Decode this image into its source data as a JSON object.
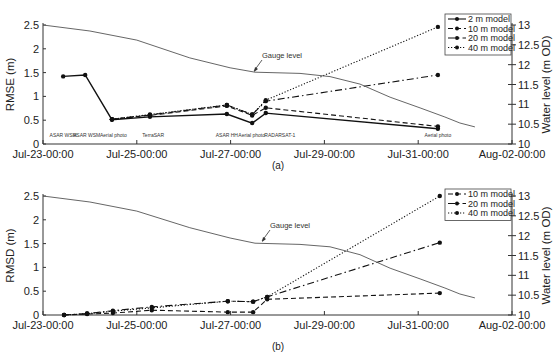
{
  "figure": {
    "panels": [
      {
        "caption": "(a)",
        "ylabel_left": "RMSE (m)",
        "ylabel_right": "Water level (m OD)",
        "annotation": "Gauge level"
      },
      {
        "caption": "(b)",
        "ylabel_left": "RMSD (m)",
        "ylabel_right": "Water level (m OD)",
        "annotation": "Gauge level"
      }
    ],
    "xticks": [
      "Jul-23-00:00",
      "Jul-25-00:00",
      "Jul-27-00:00",
      "Jul-29-00:00",
      "Jul-31-00:00",
      "Aug-02-00:00"
    ],
    "yticks_left": [
      "0",
      "0.5",
      "1",
      "1.5",
      "2",
      "2.5"
    ],
    "yticks_right": [
      "10",
      "10.5",
      "11",
      "11.5",
      "12",
      "12.5",
      "13"
    ],
    "sensor_labels": [
      {
        "text": "ASAR WSM",
        "day": 0.43
      },
      {
        "text": "ASAR WSM",
        "day": 0.93
      },
      {
        "text": "Aerial photo",
        "day": 1.5
      },
      {
        "text": "TerraSAR",
        "day": 2.35
      },
      {
        "text": "ASAR HH",
        "day": 3.92
      },
      {
        "text": "Aerial photo",
        "day": 4.45
      },
      {
        "text": "RADARSAT-1",
        "day": 5.05
      },
      {
        "text": "Aerial photo",
        "day": 8.42
      }
    ]
  },
  "chart_data": [
    {
      "type": "line",
      "title": "(a)",
      "xlabel": "",
      "ylabel": "RMSE (m)",
      "ylabel_right": "Water level (m OD)",
      "x_unit": "days since Jul-23-00:00",
      "xlim": [
        0,
        10
      ],
      "ylim": [
        0,
        2.5
      ],
      "ylim_right": [
        10,
        13
      ],
      "x_tick_labels": [
        "Jul-23-00:00",
        "Jul-25-00:00",
        "Jul-27-00:00",
        "Jul-29-00:00",
        "Jul-31-00:00",
        "Aug-02-00:00"
      ],
      "legend_position": "upper right",
      "series": [
        {
          "name": "2 m model",
          "style": "solid",
          "points": [
            [
              0.43,
              1.42
            ],
            [
              0.9,
              1.45
            ],
            [
              1.47,
              0.51
            ],
            [
              2.28,
              0.57
            ],
            [
              3.92,
              0.63
            ],
            [
              4.46,
              0.44
            ],
            [
              4.75,
              0.65
            ],
            [
              8.42,
              0.32
            ]
          ]
        },
        {
          "name": "10 m model",
          "style": "dashed",
          "points": [
            [
              1.47,
              0.52
            ],
            [
              2.28,
              0.6
            ],
            [
              3.92,
              0.8
            ],
            [
              4.46,
              0.6
            ],
            [
              4.75,
              0.76
            ],
            [
              8.42,
              0.37
            ]
          ]
        },
        {
          "name": "20 m model",
          "style": "dashdot",
          "points": [
            [
              1.47,
              0.52
            ],
            [
              2.28,
              0.61
            ],
            [
              3.92,
              0.82
            ],
            [
              4.46,
              0.62
            ],
            [
              4.75,
              0.9
            ],
            [
              8.42,
              1.45
            ]
          ]
        },
        {
          "name": "40 m model",
          "style": "dotted",
          "points": [
            [
              1.47,
              0.52
            ],
            [
              2.28,
              0.62
            ],
            [
              3.92,
              0.82
            ],
            [
              4.46,
              0.62
            ],
            [
              4.75,
              0.92
            ],
            [
              8.42,
              2.46
            ]
          ]
        },
        {
          "name": "Gauge level",
          "axis": "right",
          "style": "thin",
          "points": [
            [
              0,
              13.0
            ],
            [
              1,
              12.85
            ],
            [
              2,
              12.62
            ],
            [
              3.13,
              12.17
            ],
            [
              3.99,
              11.92
            ],
            [
              4.52,
              11.81
            ],
            [
              5.48,
              11.78
            ],
            [
              6.12,
              11.7
            ],
            [
              6.76,
              11.51
            ],
            [
              7.4,
              11.18
            ],
            [
              8.04,
              10.91
            ],
            [
              8.57,
              10.68
            ],
            [
              8.89,
              10.53
            ],
            [
              9.21,
              10.43
            ]
          ]
        }
      ]
    },
    {
      "type": "line",
      "title": "(b)",
      "xlabel": "",
      "ylabel": "RMSD (m)",
      "ylabel_right": "Water level (m OD)",
      "x_unit": "days since Jul-23-00:00",
      "xlim": [
        0,
        10
      ],
      "ylim": [
        0,
        2.5
      ],
      "ylim_right": [
        10,
        13
      ],
      "x_tick_labels": [
        "Jul-23-00:00",
        "Jul-25-00:00",
        "Jul-27-00:00",
        "Jul-29-00:00",
        "Jul-31-00:00",
        "Aug-02-00:00"
      ],
      "legend_position": "upper right",
      "series": [
        {
          "name": "10 m model",
          "style": "dashed",
          "points": [
            [
              0.45,
              0
            ],
            [
              0.94,
              0.02
            ],
            [
              1.49,
              0.04
            ],
            [
              2.32,
              0.1
            ],
            [
              3.94,
              0.06
            ],
            [
              4.48,
              0.06
            ],
            [
              4.78,
              0.33
            ],
            [
              8.46,
              0.46
            ]
          ]
        },
        {
          "name": "20 m model",
          "style": "dashdot",
          "points": [
            [
              0.45,
              0
            ],
            [
              0.94,
              0.03
            ],
            [
              1.49,
              0.09
            ],
            [
              2.32,
              0.17
            ],
            [
              3.94,
              0.29
            ],
            [
              4.48,
              0.28
            ],
            [
              4.78,
              0.38
            ],
            [
              8.46,
              1.52
            ]
          ]
        },
        {
          "name": "40 m model",
          "style": "dotted",
          "points": [
            [
              0.45,
              0
            ],
            [
              0.94,
              0.03
            ],
            [
              1.49,
              0.08
            ],
            [
              2.32,
              0.15
            ],
            [
              3.94,
              0.29
            ],
            [
              4.48,
              0.28
            ],
            [
              4.78,
              0.38
            ],
            [
              8.46,
              2.5
            ]
          ]
        },
        {
          "name": "Gauge level",
          "axis": "right",
          "style": "thin",
          "points": [
            [
              0,
              13.0
            ],
            [
              1,
              12.85
            ],
            [
              2,
              12.62
            ],
            [
              3.13,
              12.2
            ],
            [
              3.99,
              11.94
            ],
            [
              4.52,
              11.81
            ],
            [
              5.48,
              11.78
            ],
            [
              6.12,
              11.72
            ],
            [
              6.76,
              11.52
            ],
            [
              7.4,
              11.18
            ],
            [
              8.04,
              10.91
            ],
            [
              8.57,
              10.68
            ],
            [
              8.89,
              10.53
            ],
            [
              9.21,
              10.43
            ]
          ]
        }
      ]
    }
  ]
}
